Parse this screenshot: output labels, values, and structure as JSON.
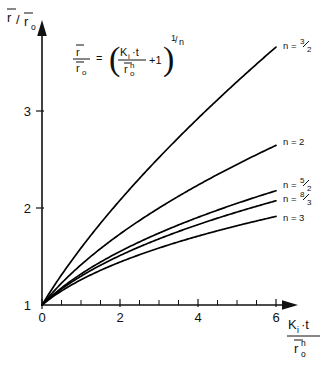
{
  "chart_data": {
    "type": "line",
    "title": "",
    "xlabel": "Ki·t / r̄0^n",
    "ylabel": "r̄ / r̄0",
    "xlim": [
      0,
      6.6
    ],
    "ylim": [
      1,
      3.6
    ],
    "xticks": [
      0,
      2,
      4,
      6
    ],
    "xticklabels": [
      "0",
      "2",
      "4",
      "6"
    ],
    "yticks": [
      1,
      2,
      3
    ],
    "yticklabels": [
      "1",
      "2",
      "3"
    ],
    "minor_tick_step": 0.5,
    "grid": false,
    "legend_position": "right-inline",
    "equation": "r̄/r̄0 = ( Ki·t / r̄0^n + 1 )^(1/n)",
    "series": [
      {
        "name": "n = 3/2",
        "n": 1.5,
        "label_numerator": "3",
        "label_denominator": "2",
        "x": [
          0,
          0.25,
          0.5,
          0.75,
          1,
          1.5,
          2,
          2.5,
          3,
          3.5,
          4,
          4.5,
          5,
          5.5,
          6
        ],
        "values": [
          1,
          1.157,
          1.31,
          1.449,
          1.587,
          1.842,
          2.08,
          2.305,
          2.52,
          2.726,
          2.924,
          3.116,
          3.302,
          3.482,
          3.659
        ]
      },
      {
        "name": "n = 2",
        "n": 2,
        "label_numerator": "",
        "label_denominator": "",
        "x": [
          0,
          0.25,
          0.5,
          0.75,
          1,
          1.5,
          2,
          2.5,
          3,
          3.5,
          4,
          4.5,
          5,
          5.5,
          6
        ],
        "values": [
          1,
          1.118,
          1.225,
          1.323,
          1.414,
          1.581,
          1.732,
          1.871,
          2.0,
          2.121,
          2.236,
          2.345,
          2.449,
          2.55,
          2.646
        ]
      },
      {
        "name": "n = 5/2",
        "n": 2.5,
        "label_numerator": "5",
        "label_denominator": "2",
        "x": [
          0,
          0.25,
          0.5,
          0.75,
          1,
          1.5,
          2,
          2.5,
          3,
          3.5,
          4,
          4.5,
          5,
          5.5,
          6
        ],
        "values": [
          1,
          1.093,
          1.176,
          1.251,
          1.32,
          1.443,
          1.552,
          1.65,
          1.741,
          1.825,
          1.904,
          1.978,
          2.048,
          2.115,
          2.178
        ]
      },
      {
        "name": "n = 8/3",
        "n": 2.6667,
        "label_numerator": "8",
        "label_denominator": "3",
        "x": [
          0,
          0.25,
          0.5,
          0.75,
          1,
          1.5,
          2,
          2.5,
          3,
          3.5,
          4,
          4.5,
          5,
          5.5,
          6
        ],
        "values": [
          1,
          1.087,
          1.164,
          1.234,
          1.297,
          1.411,
          1.511,
          1.601,
          1.683,
          1.759,
          1.831,
          1.898,
          1.961,
          2.021,
          2.078
        ]
      },
      {
        "name": "n = 3",
        "n": 3,
        "label_numerator": "",
        "label_denominator": "",
        "x": [
          0,
          0.25,
          0.5,
          0.75,
          1,
          1.5,
          2,
          2.5,
          3,
          3.5,
          4,
          4.5,
          5,
          5.5,
          6
        ],
        "values": [
          1,
          1.077,
          1.145,
          1.205,
          1.26,
          1.357,
          1.442,
          1.518,
          1.587,
          1.651,
          1.71,
          1.765,
          1.817,
          1.866,
          1.913
        ]
      }
    ]
  },
  "axes": {
    "y_label_num": "r",
    "y_label_slash": "/",
    "y_label_den": "r",
    "y_label_den_sub": "o",
    "x_label_num_k": "K",
    "x_label_num_k_sub": "i",
    "x_label_num_dot": "·t",
    "x_label_den_r": "r",
    "x_label_den_sub": "o",
    "x_label_den_sup": "n"
  },
  "equation": {
    "lhs_num": "r",
    "lhs_den": "r",
    "lhs_den_sub": "o",
    "equals": "=",
    "paren_open": "(",
    "paren_close": ")",
    "inner_num_k": "K",
    "inner_num_k_sub": "i",
    "inner_num_dot": "·t",
    "inner_den_r": "r",
    "inner_den_sub": "o",
    "inner_den_sup": "n",
    "plus_one": "+1",
    "exp_num": "1",
    "exp_slash": "/",
    "exp_den": "n"
  },
  "labels": {
    "n_prefix": "n ="
  },
  "colors": {
    "curve": "#000000",
    "axis": "#111111",
    "background": "#ffffff"
  }
}
